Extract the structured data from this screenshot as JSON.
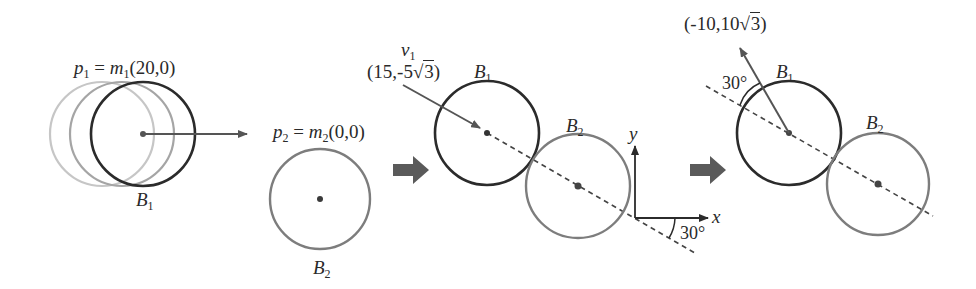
{
  "colors": {
    "b1_stroke": "#2b2b2b",
    "b2_stroke": "#7a7a7a",
    "ghost_1": "#c4c4c4",
    "ghost_2": "#a3a3a3",
    "arrow": "#555555",
    "big_arrow": "#5a5a5a",
    "text": "#2a2a2a"
  },
  "panel1": {
    "momentum_label": {
      "var": "p",
      "sub": "1",
      "eq": " = ",
      "mass": "m",
      "mass_sub": "1",
      "vector": "(20,0)"
    },
    "ball_label": {
      "var": "B",
      "sub": "1"
    }
  },
  "panel2": {
    "momentum_label": {
      "var": "p",
      "sub": "2",
      "eq": " = ",
      "mass": "m",
      "mass_sub": "2",
      "vector": "(0,0)"
    },
    "ball_label": {
      "var": "B",
      "sub": "2"
    }
  },
  "panel3": {
    "velocity_label": {
      "var": "v",
      "sub": "1"
    },
    "velocity_vector": {
      "prefix": "(15,-5",
      "radicand": "3",
      "suffix": ")"
    },
    "b1_label": {
      "var": "B",
      "sub": "1"
    },
    "b2_label": {
      "var": "B",
      "sub": "2"
    },
    "axis_x": "x",
    "axis_y": "y",
    "angle": "30°"
  },
  "panel4": {
    "velocity_vector": {
      "prefix": "(-10,10",
      "radicand": "3",
      "suffix": ")"
    },
    "b1_label": {
      "var": "B",
      "sub": "1"
    },
    "b2_label": {
      "var": "B",
      "sub": "2"
    },
    "angle": "30°"
  }
}
